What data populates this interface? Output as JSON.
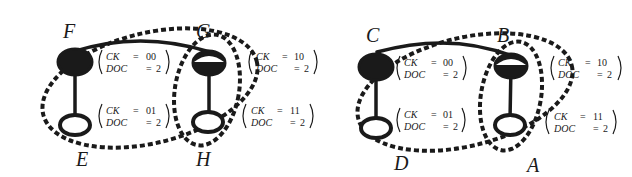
{
  "diagram": {
    "left": {
      "nodes": {
        "top_left": {
          "label": "F",
          "ck_key": "CK",
          "ck_val": "00",
          "doc_key": "DOC",
          "doc_val": "2"
        },
        "top_right": {
          "label": "G",
          "ck_key": "CK",
          "ck_val": "10",
          "doc_key": "DOC",
          "doc_val": "2"
        },
        "bottom_left": {
          "label": "E",
          "ck_key": "CK",
          "ck_val": "01",
          "doc_key": "DOC",
          "doc_val": "2"
        },
        "bottom_right": {
          "label": "H",
          "ck_key": "CK",
          "ck_val": "11",
          "doc_key": "DOC",
          "doc_val": "2"
        }
      }
    },
    "right": {
      "nodes": {
        "top_left": {
          "label": "C",
          "ck_key": "CK",
          "ck_val": "00",
          "doc_key": "DOC",
          "doc_val": "2"
        },
        "top_right": {
          "label": "B",
          "ck_key": "CK",
          "ck_val": "10",
          "doc_key": "DOC",
          "doc_val": "2"
        },
        "bottom_left": {
          "label": "D",
          "ck_key": "CK",
          "ck_val": "01",
          "doc_key": "DOC",
          "doc_val": "2"
        },
        "bottom_right": {
          "label": "A",
          "ck_key": "CK",
          "ck_val": "11",
          "doc_key": "DOC",
          "doc_val": "2"
        }
      }
    },
    "colors": {
      "ink": "#1a1a1a",
      "background": "#ffffff"
    }
  }
}
